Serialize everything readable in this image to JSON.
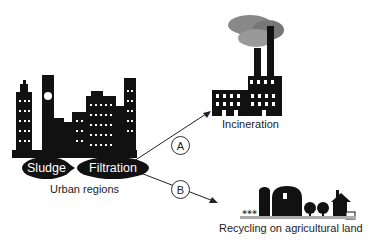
{
  "diagram": {
    "source": {
      "label": "Urban regions",
      "steps": [
        "Sludge",
        "Filtration"
      ]
    },
    "routes": [
      {
        "id": "A",
        "target": "Incineration"
      },
      {
        "id": "B",
        "target": "Recycling on agricultural land"
      }
    ]
  }
}
